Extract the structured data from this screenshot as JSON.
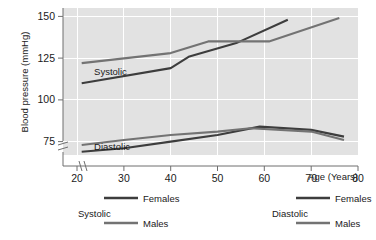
{
  "chart_data": {
    "type": "line",
    "title": "",
    "xlabel": "Age (Years)",
    "ylabel": "Blood pressure (mmHg)",
    "xlim": [
      17,
      80
    ],
    "ylim": [
      67,
      155
    ],
    "xticks": [
      20,
      30,
      40,
      50,
      60,
      70,
      80
    ],
    "yticks": [
      75,
      100,
      125,
      150
    ],
    "xtick_labels": [
      "20",
      "30",
      "40",
      "50",
      "60",
      "70",
      "80"
    ],
    "ytick_labels": [
      "75",
      "100",
      "125",
      "150"
    ],
    "grid": true,
    "axis_break_x": true,
    "axis_break_y": true,
    "legend_position": "below-plot",
    "plot_background": "#e2e2e2",
    "gridline_color": "#ffffff",
    "series": [
      {
        "name": "Systolic Females",
        "group": "Systolic",
        "sex": "Females",
        "color": "#3d3d3d",
        "x": [
          21,
          40,
          44,
          54,
          65
        ],
        "values": [
          110,
          119,
          126,
          134,
          148
        ]
      },
      {
        "name": "Systolic Males",
        "group": "Systolic",
        "sex": "Males",
        "color": "#737373",
        "x": [
          21,
          40,
          48,
          61,
          76
        ],
        "values": [
          122,
          128,
          135,
          135,
          149
        ]
      },
      {
        "name": "Diastolic Females",
        "group": "Diastolic",
        "sex": "Females",
        "color": "#3d3d3d",
        "x": [
          21,
          30,
          40,
          50,
          59,
          70,
          77
        ],
        "values": [
          69,
          71,
          75,
          79,
          84,
          82,
          78
        ]
      },
      {
        "name": "Diastolic Males",
        "group": "Diastolic",
        "sex": "Males",
        "color": "#737373",
        "x": [
          21,
          30,
          40,
          50,
          57,
          70,
          77
        ],
        "values": [
          73,
          76,
          79,
          81,
          83,
          81,
          76
        ]
      }
    ],
    "annotations": [
      {
        "text": "Systolic",
        "x": 23,
        "y": 117
      },
      {
        "text": "Diastolic",
        "x": 23,
        "y": 72
      }
    ]
  },
  "axes": {
    "y_title": "Blood pressure (mmHg)",
    "x_title": "Age (Years)",
    "y_ticks": [
      "150",
      "125",
      "100",
      "75"
    ],
    "x_ticks": [
      "20",
      "30",
      "40",
      "50",
      "60",
      "70",
      "80"
    ]
  },
  "plot_labels": {
    "systolic": "Systolic",
    "diastolic": "Diastolic"
  },
  "legend": {
    "groups": [
      {
        "title": "Systolic",
        "entries": [
          {
            "label": "Females",
            "color": "#3d3d3d"
          },
          {
            "label": "Males",
            "color": "#737373"
          }
        ]
      },
      {
        "title": "Diastolic",
        "entries": [
          {
            "label": "Females",
            "color": "#3d3d3d"
          },
          {
            "label": "Males",
            "color": "#737373"
          }
        ]
      }
    ]
  }
}
